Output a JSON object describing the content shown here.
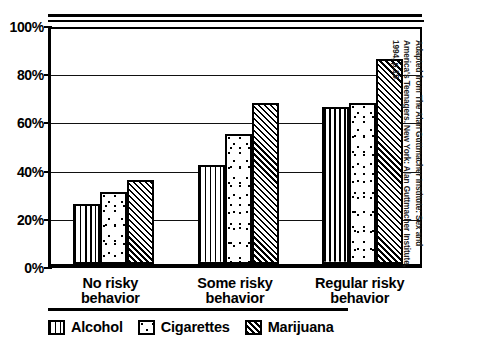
{
  "chart_data": {
    "type": "bar",
    "title": "",
    "xlabel": "",
    "ylabel": "",
    "ylim": [
      0,
      100
    ],
    "ytick_labels": [
      "0%",
      "20%",
      "40%",
      "60%",
      "80%",
      "100%"
    ],
    "ytick_values": [
      0,
      20,
      40,
      60,
      80,
      100
    ],
    "grid": true,
    "legend_position": "bottom-left",
    "categories": [
      "No risky behavior",
      "Some risky behavior",
      "Regular risky behavior"
    ],
    "series": [
      {
        "name": "Alcohol",
        "pattern": "vertical-lines",
        "values": [
          25,
          41,
          65
        ]
      },
      {
        "name": "Cigarettes",
        "pattern": "dots",
        "values": [
          30,
          54,
          67
        ]
      },
      {
        "name": "Marijuana",
        "pattern": "diagonal-hatch",
        "values": [
          35,
          67,
          85
        ]
      }
    ],
    "source_note": "Adapted from The Alan Guttmacher Institute: Sex and America's Teenagers. New York: Alan Guttmacher Institute, 1994, p.19."
  }
}
